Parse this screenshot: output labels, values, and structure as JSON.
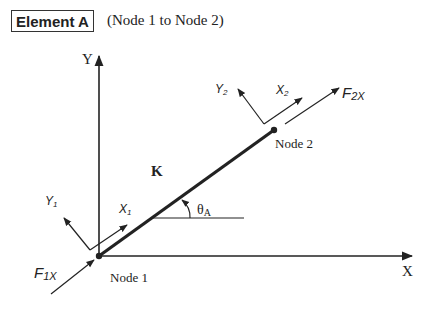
{
  "header": {
    "title": "Element A",
    "subtitle": "(Node 1 to Node 2)"
  },
  "diagram": {
    "global_axes": {
      "x_label": "X",
      "y_label": "Y"
    },
    "element": {
      "stiffness_label": "K",
      "angle_label": "θ",
      "angle_subscript": "A"
    },
    "nodes": [
      {
        "label": "Node 1"
      },
      {
        "label": "Node 2"
      }
    ],
    "local_axes": {
      "node1": {
        "x_label": "X",
        "x_sub": "1",
        "y_label": "Y",
        "y_sub": "1"
      },
      "node2": {
        "x_label": "X",
        "x_sub": "2",
        "y_label": "Y",
        "y_sub": "2"
      }
    },
    "forces": [
      {
        "label": "F",
        "sub": "1X"
      },
      {
        "label": "F",
        "sub": "2X"
      }
    ],
    "colors": {
      "line": "#222222",
      "background": "#ffffff"
    }
  }
}
